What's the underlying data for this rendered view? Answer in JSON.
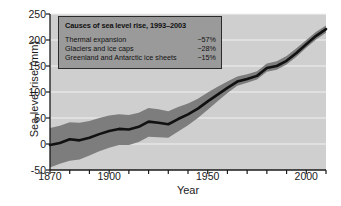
{
  "chart_data": {
    "type": "line",
    "title": "",
    "xlabel": "Year",
    "ylabel": "Sea level rise (mm)",
    "xlim": [
      1870,
      2010
    ],
    "ylim": [
      -50,
      250
    ],
    "xticks": [
      1870,
      1880,
      1890,
      1900,
      1910,
      1920,
      1930,
      1940,
      1950,
      1960,
      1970,
      1980,
      1990,
      2000,
      2010
    ],
    "xtick_labels": [
      {
        "value": 1870,
        "label": "1870"
      },
      {
        "value": 1900,
        "label": "1900"
      },
      {
        "value": 1950,
        "label": "1950"
      },
      {
        "value": 2000,
        "label": "2000"
      }
    ],
    "yticks": [
      -50,
      0,
      50,
      100,
      150,
      200,
      250
    ],
    "ytick_labels": [
      "-50",
      "0",
      "50",
      "100",
      "150",
      "200",
      "250"
    ],
    "grid": "horizontal-white",
    "legend_position": "inside-top-left",
    "series": [
      {
        "name": "Sea level rise",
        "style": "line",
        "color": "#111111",
        "x": [
          1870,
          1875,
          1880,
          1885,
          1890,
          1895,
          1900,
          1905,
          1910,
          1915,
          1920,
          1925,
          1930,
          1935,
          1940,
          1945,
          1950,
          1955,
          1960,
          1965,
          1970,
          1975,
          1980,
          1985,
          1990,
          1995,
          2000,
          2005,
          2010
        ],
        "values": [
          -2,
          2,
          9,
          7,
          12,
          19,
          25,
          29,
          28,
          33,
          43,
          41,
          38,
          48,
          57,
          68,
          82,
          95,
          108,
          120,
          125,
          131,
          146,
          150,
          160,
          175,
          192,
          208,
          221
        ]
      }
    ],
    "uncertainty_band": {
      "name": "Uncertainty range",
      "color": "#7d7d7d",
      "x": [
        1870,
        1875,
        1880,
        1885,
        1890,
        1895,
        1900,
        1905,
        1910,
        1915,
        1920,
        1925,
        1930,
        1935,
        1940,
        1945,
        1950,
        1955,
        1960,
        1965,
        1970,
        1975,
        1980,
        1985,
        1990,
        1995,
        2000,
        2005,
        2010
      ],
      "lower": [
        -45,
        -38,
        -32,
        -30,
        -22,
        -14,
        -7,
        -2,
        -2,
        4,
        14,
        13,
        12,
        24,
        36,
        50,
        66,
        82,
        98,
        112,
        118,
        124,
        139,
        143,
        153,
        168,
        185,
        201,
        214
      ],
      "upper": [
        31,
        35,
        42,
        41,
        44,
        50,
        55,
        57,
        56,
        60,
        69,
        67,
        63,
        71,
        78,
        87,
        99,
        110,
        120,
        130,
        134,
        140,
        155,
        159,
        169,
        184,
        200,
        216,
        228
      ]
    }
  },
  "legend": {
    "title": "Causes of sea level rise, 1993–2003",
    "rows": [
      {
        "label": "Thermal expansion",
        "value": "~57%"
      },
      {
        "label": "Glaciers and ice caps",
        "value": "~28%"
      },
      {
        "label": "Greenland and Antarctic ice sheets",
        "value": "~15%"
      }
    ]
  },
  "colors": {
    "plot_background": "#cfcfcf",
    "gridline": "#f2f2f2",
    "band": "#7d7d7d",
    "line": "#111111",
    "axis": "#1a1a1a",
    "legend_fill": "#9a9a9a",
    "legend_border": "#2b2b2b",
    "page_background": "#ffffff"
  }
}
